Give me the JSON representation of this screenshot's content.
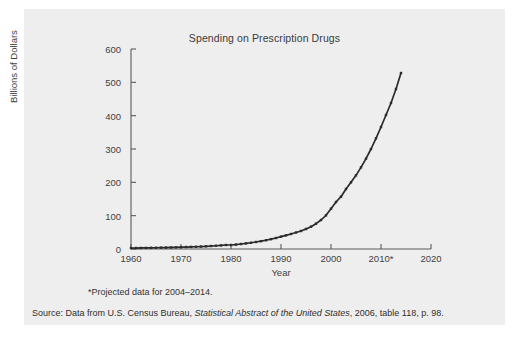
{
  "figure": {
    "footnote": "*Projected data for 2004–2014.",
    "source_prefix": "Source: Data from U.S. Census Bureau, ",
    "source_italic": "Statistical Abstract of the United States",
    "source_suffix": ", 2006, table 118, p. 98."
  },
  "chart_data": {
    "type": "line",
    "title": "Spending on Prescription Drugs",
    "xlabel": "Year",
    "ylabel": "Billions of Dollars",
    "xlim": [
      1960,
      2020
    ],
    "ylim": [
      0,
      600
    ],
    "xticks": [
      1960,
      1970,
      1980,
      1990,
      2000,
      2010,
      2020
    ],
    "xticklabels": [
      "1960",
      "1970",
      "1980",
      "1990",
      "2000",
      "2010*",
      "2020"
    ],
    "yticks": [
      0,
      100,
      200,
      300,
      400,
      500,
      600
    ],
    "yticklabels": [
      "0",
      "100",
      "200",
      "300",
      "400",
      "500",
      "600"
    ],
    "grid": false,
    "legend": null,
    "marker": "square",
    "line_color": "#2b2b2b",
    "series": [
      {
        "name": "Spending on prescription drugs",
        "x": [
          1960,
          1961,
          1962,
          1963,
          1964,
          1965,
          1966,
          1967,
          1968,
          1969,
          1970,
          1971,
          1972,
          1973,
          1974,
          1975,
          1976,
          1977,
          1978,
          1979,
          1980,
          1981,
          1982,
          1983,
          1984,
          1985,
          1986,
          1987,
          1988,
          1989,
          1990,
          1991,
          1992,
          1993,
          1994,
          1995,
          1996,
          1997,
          1998,
          1999,
          2000,
          2001,
          2002,
          2003,
          2004,
          2005,
          2006,
          2007,
          2008,
          2009,
          2010,
          2011,
          2012,
          2013,
          2014
        ],
        "values": [
          2.7,
          2.9,
          3.1,
          3.3,
          3.5,
          3.7,
          4.0,
          4.3,
          4.6,
          5.0,
          5.5,
          5.9,
          6.3,
          6.8,
          7.4,
          8.1,
          8.9,
          9.8,
          10.8,
          12.0,
          12.0,
          13.4,
          15.0,
          16.8,
          18.8,
          21.0,
          23.5,
          26.3,
          29.5,
          33.0,
          37.0,
          41.0,
          45.0,
          49.5,
          54.0,
          60.0,
          67.0,
          76.0,
          87.0,
          101.0,
          121.0,
          141.0,
          157.0,
          180.0,
          200.0,
          221.0,
          245.0,
          271.0,
          300.0,
          332.0,
          366.0,
          402.0,
          438.0,
          480.0,
          528.0
        ]
      }
    ]
  }
}
